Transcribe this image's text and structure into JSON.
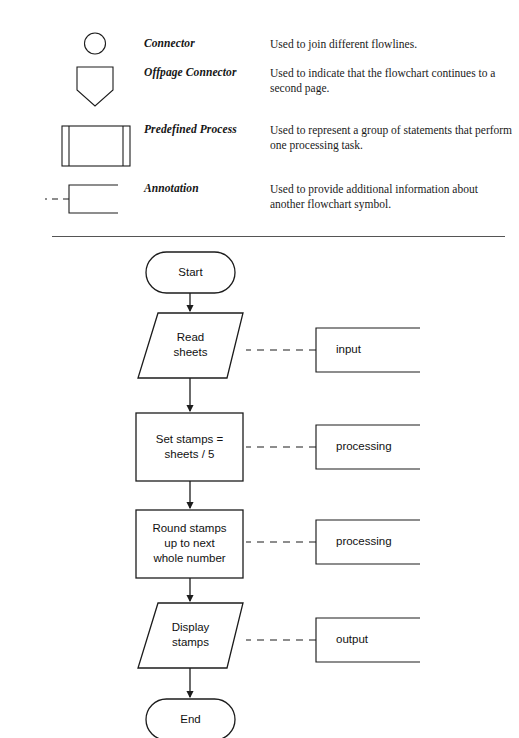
{
  "page": {
    "background_color": "#ffffff",
    "ink_color": "#1a1a1a",
    "divider": {
      "label": "section-divider"
    }
  },
  "legend": {
    "title": "Flowchart symbols",
    "rows": [
      {
        "symbol": "connector-circle",
        "term": "Connector",
        "description": "Used to join different flowlines."
      },
      {
        "symbol": "offpage-connector-pentagon",
        "term": "Offpage Connector",
        "description": "Used to indicate that the flowchart continues to a second page."
      },
      {
        "symbol": "predefined-process-box",
        "term": "Predefined Process",
        "description": "Used to represent a group of statements that perform one processing task."
      },
      {
        "symbol": "annotation-bracket",
        "term": "Annotation",
        "description": "Used to provide additional information about another flowchart symbol."
      }
    ]
  },
  "flowchart": {
    "title": "Postage stamps flowchart",
    "nodes": [
      {
        "id": "start",
        "shape": "terminal",
        "label": "Start"
      },
      {
        "id": "read",
        "shape": "parallelogram",
        "label": "Read\nsheets"
      },
      {
        "id": "setstamps",
        "shape": "process",
        "label": "Set stamps =\nsheets / 5"
      },
      {
        "id": "round",
        "shape": "process",
        "label": "Round stamps\nup to next\nwhole number"
      },
      {
        "id": "display",
        "shape": "parallelogram",
        "label": "Display\nstamps"
      },
      {
        "id": "end",
        "shape": "terminal",
        "label": "End"
      }
    ],
    "annotations": [
      {
        "id": "ann-input",
        "attached_to": "read",
        "label": "input"
      },
      {
        "id": "ann-processing-1",
        "attached_to": "setstamps",
        "label": "processing"
      },
      {
        "id": "ann-processing-2",
        "attached_to": "round",
        "label": "processing"
      },
      {
        "id": "ann-output",
        "attached_to": "display",
        "label": "output"
      }
    ],
    "flow_order": [
      "start",
      "read",
      "setstamps",
      "round",
      "display",
      "end"
    ]
  }
}
